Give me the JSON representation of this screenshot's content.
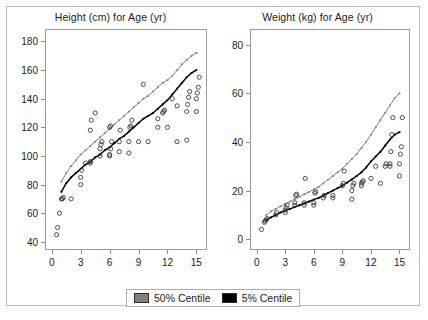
{
  "legend": {
    "entries": [
      {
        "label": "50% Centile",
        "color": "#808080"
      },
      {
        "label": "5% Centile",
        "color": "#000000"
      }
    ]
  },
  "chart_data": [
    {
      "type": "scatter",
      "title": "Height (cm) for Age (yr)",
      "xlabel": "Age (yr)",
      "ylabel": "Height (cm)",
      "xlim": [
        -0.6,
        16.0
      ],
      "ylim": [
        35,
        188
      ],
      "xticks": [
        0,
        3,
        6,
        9,
        12,
        15
      ],
      "yticks": [
        40,
        60,
        80,
        100,
        120,
        140,
        160,
        180
      ],
      "grid": false,
      "legend_position": "bottom-center-shared",
      "series": [
        {
          "name": "50% Centile",
          "type": "line",
          "color": "#808080",
          "x": [
            1,
            1.5,
            2,
            2.5,
            3,
            3.5,
            4,
            4.5,
            5,
            5.5,
            6,
            6.5,
            7,
            7.5,
            8,
            8.5,
            9,
            9.5,
            10,
            10.5,
            11,
            11.5,
            12,
            12.5,
            13,
            13.5,
            14,
            14.5,
            15
          ],
          "y": [
            82,
            88,
            93,
            97,
            101,
            104,
            107,
            110,
            113,
            116,
            119,
            122,
            125,
            128,
            131,
            134,
            137,
            140,
            142,
            145,
            148,
            151,
            153,
            156,
            160,
            164,
            167,
            170,
            172
          ]
        },
        {
          "name": "5% Centile",
          "type": "line",
          "color": "#000000",
          "x": [
            1,
            1.5,
            2,
            2.5,
            3,
            3.5,
            4,
            4.5,
            5,
            5.5,
            6,
            6.5,
            7,
            7.5,
            8,
            8.5,
            9,
            9.5,
            10,
            10.5,
            11,
            11.5,
            12,
            12.5,
            13,
            13.5,
            14,
            14.5,
            15
          ],
          "y": [
            75,
            81,
            85,
            88,
            91,
            94,
            96,
            99,
            101,
            104,
            106,
            109,
            112,
            114,
            117,
            120,
            123,
            126,
            128,
            130,
            133,
            136,
            139,
            143,
            147,
            151,
            155,
            158,
            160
          ]
        },
        {
          "name": "Observations",
          "type": "scatter",
          "marker": "open-circle",
          "color": "#3a3a3a",
          "points": [
            [
              0.5,
              45
            ],
            [
              0.6,
              50
            ],
            [
              0.8,
              60
            ],
            [
              1.0,
              70
            ],
            [
              1.1,
              70
            ],
            [
              1.2,
              71
            ],
            [
              2.0,
              70
            ],
            [
              3.0,
              80
            ],
            [
              3.0,
              85
            ],
            [
              3.1,
              90
            ],
            [
              3.5,
              95
            ],
            [
              4.0,
              95
            ],
            [
              4.0,
              96
            ],
            [
              5.0,
              100
            ],
            [
              5.0,
              105
            ],
            [
              5.1,
              108
            ],
            [
              5.2,
              110
            ],
            [
              4.0,
              118
            ],
            [
              4.1,
              125
            ],
            [
              4.5,
              130
            ],
            [
              6.0,
              100
            ],
            [
              6.0,
              101
            ],
            [
              6.1,
              105
            ],
            [
              6.2,
              110
            ],
            [
              6.0,
              120
            ],
            [
              6.1,
              121
            ],
            [
              7.0,
              103
            ],
            [
              7.0,
              110
            ],
            [
              7.1,
              118
            ],
            [
              8.0,
              102
            ],
            [
              8.0,
              110
            ],
            [
              8.1,
              120
            ],
            [
              8.2,
              121
            ],
            [
              8.3,
              125
            ],
            [
              9.0,
              110
            ],
            [
              9.5,
              150
            ],
            [
              10.0,
              110
            ],
            [
              11.0,
              120
            ],
            [
              11.0,
              126
            ],
            [
              11.5,
              130
            ],
            [
              11.6,
              131
            ],
            [
              11.7,
              132
            ],
            [
              12.0,
              120
            ],
            [
              12.5,
              140
            ],
            [
              13.0,
              110
            ],
            [
              13.0,
              135
            ],
            [
              14.0,
              111
            ],
            [
              14.0,
              131
            ],
            [
              14.1,
              136
            ],
            [
              14.2,
              141
            ],
            [
              14.3,
              145
            ],
            [
              15.0,
              131
            ],
            [
              15.0,
              140
            ],
            [
              15.1,
              144
            ],
            [
              15.2,
              148
            ],
            [
              15.3,
              155
            ]
          ]
        }
      ]
    },
    {
      "type": "scatter",
      "title": "Weight (kg) for Age (yr)",
      "xlabel": "Age (yr)",
      "ylabel": "Weight (kg)",
      "xlim": [
        -0.6,
        16.0
      ],
      "ylim": [
        -4,
        86
      ],
      "xticks": [
        0,
        3,
        6,
        9,
        12,
        15
      ],
      "yticks": [
        0,
        20,
        40,
        60,
        80
      ],
      "grid": false,
      "legend_position": "bottom-center-shared",
      "series": [
        {
          "name": "50% Centile",
          "type": "line",
          "color": "#808080",
          "x": [
            1,
            1.5,
            2,
            2.5,
            3,
            3.5,
            4,
            4.5,
            5,
            5.5,
            6,
            6.5,
            7,
            7.5,
            8,
            8.5,
            9,
            9.5,
            10,
            10.5,
            11,
            11.5,
            12,
            12.5,
            13,
            13.5,
            14,
            14.5,
            15
          ],
          "y": [
            10,
            11.5,
            12.5,
            13.5,
            14.5,
            15.5,
            16.5,
            17.5,
            18.5,
            19.5,
            20.5,
            21.5,
            23,
            24.5,
            26,
            27.5,
            29,
            31,
            33,
            35,
            37.5,
            40,
            43,
            46,
            49,
            52,
            55,
            58,
            60
          ]
        },
        {
          "name": "5% Centile",
          "type": "line",
          "color": "#000000",
          "x": [
            1,
            1.5,
            2,
            2.5,
            3,
            3.5,
            4,
            4.5,
            5,
            5.5,
            6,
            6.5,
            7,
            7.5,
            8,
            8.5,
            9,
            9.5,
            10,
            10.5,
            11,
            11.5,
            12,
            12.5,
            13,
            13.5,
            14,
            14.5,
            15
          ],
          "y": [
            8,
            9,
            10,
            11,
            11.8,
            12.5,
            13.2,
            14,
            14.8,
            15.5,
            16.3,
            17,
            18,
            19,
            20,
            21,
            22,
            23.3,
            24.6,
            26,
            27.5,
            29.5,
            32,
            34,
            36,
            38.5,
            41,
            43,
            44
          ]
        },
        {
          "name": "Observations",
          "type": "scatter",
          "marker": "open-circle",
          "color": "#3a3a3a",
          "points": [
            [
              0.5,
              4
            ],
            [
              0.8,
              7
            ],
            [
              0.9,
              7.5
            ],
            [
              1.0,
              8
            ],
            [
              1.1,
              8.5
            ],
            [
              2.0,
              10
            ],
            [
              2.1,
              11
            ],
            [
              3.0,
              11
            ],
            [
              3.0,
              12
            ],
            [
              3.1,
              13
            ],
            [
              3.2,
              14
            ],
            [
              4.0,
              14
            ],
            [
              4.0,
              15
            ],
            [
              4.1,
              18
            ],
            [
              4.2,
              18.5
            ],
            [
              5.0,
              14
            ],
            [
              5.0,
              15
            ],
            [
              5.1,
              25
            ],
            [
              6.0,
              14
            ],
            [
              6.0,
              15
            ],
            [
              6.1,
              19
            ],
            [
              6.2,
              19.5
            ],
            [
              7.0,
              17
            ],
            [
              7.1,
              18
            ],
            [
              8.0,
              17
            ],
            [
              8.0,
              18
            ],
            [
              9.0,
              22
            ],
            [
              9.1,
              23
            ],
            [
              9.2,
              28
            ],
            [
              10.0,
              16.5
            ],
            [
              10.0,
              20
            ],
            [
              10.1,
              22
            ],
            [
              10.2,
              23
            ],
            [
              11.0,
              22
            ],
            [
              11.0,
              23
            ],
            [
              11.1,
              23.5
            ],
            [
              11.2,
              24
            ],
            [
              12.0,
              25
            ],
            [
              12.5,
              30
            ],
            [
              13.0,
              23
            ],
            [
              13.5,
              30
            ],
            [
              13.6,
              31
            ],
            [
              14.0,
              30
            ],
            [
              14.0,
              31
            ],
            [
              14.1,
              36
            ],
            [
              14.2,
              43
            ],
            [
              14.3,
              50
            ],
            [
              15.0,
              26
            ],
            [
              15.0,
              31
            ],
            [
              15.1,
              35
            ],
            [
              15.2,
              38
            ],
            [
              15.3,
              50
            ]
          ]
        }
      ]
    }
  ]
}
